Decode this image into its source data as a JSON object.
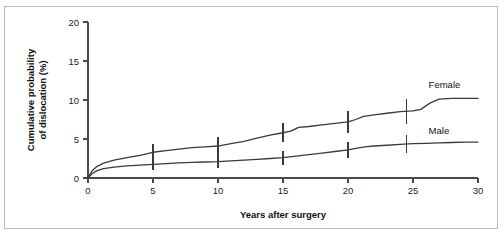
{
  "chart_data": {
    "type": "line",
    "title": "",
    "xlabel": "Years after surgery",
    "ylabel": "Cumulative probability of dislocation (%)",
    "ylabel_line1": "Cumulative probability",
    "ylabel_line2": "of dislocation (%)",
    "xlim": [
      0,
      30
    ],
    "ylim": [
      0,
      20
    ],
    "xticks": [
      0,
      5,
      10,
      15,
      20,
      25,
      30
    ],
    "yticks": [
      0,
      5,
      10,
      15,
      20
    ],
    "xtick_labels": [
      "0",
      "5",
      "10",
      "15",
      "20",
      "25",
      "30"
    ],
    "ytick_labels": [
      "0",
      "5",
      "10",
      "15",
      "20"
    ],
    "grid": false,
    "legend_position": "inline-right-of-curves",
    "line_color": "#3a3a3a",
    "series": [
      {
        "name": "Female",
        "label": "Female",
        "label_x": 26.2,
        "label_y": 11.6,
        "x": [
          0,
          0.3,
          0.7,
          1.2,
          2,
          3,
          4,
          5,
          6,
          7,
          8,
          9,
          10,
          11,
          12,
          13,
          14,
          15,
          15.6,
          16.2,
          17,
          18,
          19,
          20,
          20.6,
          21.2,
          22,
          23,
          24,
          25,
          25.6,
          26.3,
          27,
          28,
          29,
          30
        ],
        "y": [
          0,
          0.9,
          1.5,
          1.9,
          2.3,
          2.6,
          2.9,
          3.3,
          3.5,
          3.7,
          3.9,
          4.0,
          4.1,
          4.4,
          4.7,
          5.1,
          5.5,
          5.8,
          6.0,
          6.5,
          6.6,
          6.8,
          7.0,
          7.2,
          7.5,
          7.9,
          8.1,
          8.3,
          8.5,
          8.6,
          8.8,
          9.6,
          10.1,
          10.2,
          10.2,
          10.2
        ],
        "errorbars": [
          {
            "x": 5,
            "y": 3.3,
            "low": 2.2,
            "high": 4.4
          },
          {
            "x": 10,
            "y": 4.1,
            "low": 3.0,
            "high": 5.3
          },
          {
            "x": 15,
            "y": 5.8,
            "low": 4.6,
            "high": 7.1
          },
          {
            "x": 20,
            "y": 7.2,
            "low": 5.8,
            "high": 8.6
          },
          {
            "x": 24.5,
            "y": 8.5,
            "low": 6.9,
            "high": 10.1
          }
        ]
      },
      {
        "name": "Male",
        "label": "Male",
        "label_x": 26.2,
        "label_y": 5.6,
        "x": [
          0,
          0.3,
          0.7,
          1.2,
          2,
          3,
          4,
          5,
          6,
          7,
          8,
          9,
          10,
          11,
          12,
          13,
          14,
          15,
          16,
          17,
          18,
          19,
          20,
          20.6,
          21.3,
          22,
          23,
          24,
          25,
          26,
          27,
          28,
          29,
          30
        ],
        "y": [
          0,
          0.55,
          0.95,
          1.2,
          1.4,
          1.55,
          1.65,
          1.75,
          1.85,
          1.95,
          2.0,
          2.05,
          2.1,
          2.2,
          2.3,
          2.4,
          2.5,
          2.6,
          2.8,
          3.0,
          3.2,
          3.4,
          3.6,
          3.8,
          4.0,
          4.1,
          4.2,
          4.3,
          4.4,
          4.45,
          4.5,
          4.55,
          4.6,
          4.6
        ],
        "errorbars": [
          {
            "x": 5,
            "y": 1.75,
            "low": 1.0,
            "high": 2.5
          },
          {
            "x": 10,
            "y": 2.1,
            "low": 1.3,
            "high": 2.9
          },
          {
            "x": 15,
            "y": 2.6,
            "low": 1.7,
            "high": 3.5
          },
          {
            "x": 20,
            "y": 3.6,
            "low": 2.6,
            "high": 4.6
          },
          {
            "x": 24.5,
            "y": 4.35,
            "low": 3.2,
            "high": 5.5
          }
        ]
      }
    ]
  }
}
